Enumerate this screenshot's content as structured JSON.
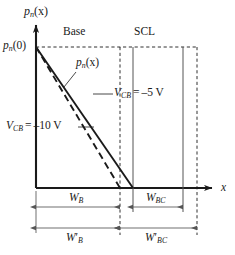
{
  "figure": {
    "axes": {
      "y_axis_label": "p_n(x)",
      "x_axis_label": "x",
      "origin_value_label": "p_n(0)"
    },
    "regions": [
      {
        "name": "base-region",
        "label": "Base"
      },
      {
        "name": "scl-region",
        "label": "SCL"
      }
    ],
    "curves": [
      {
        "name": "carrier-profile-solid",
        "label": "p_n(x)",
        "style": "solid",
        "bias_label": "V_CB = –5 V",
        "bias_value": -5,
        "bias_unit": "V"
      },
      {
        "name": "carrier-profile-dashed",
        "label": "",
        "style": "dashed",
        "bias_label": "V_CB = –10 V",
        "bias_value": -10,
        "bias_unit": "V"
      }
    ],
    "dimensions": [
      {
        "name": "base-width-reduced",
        "label": "W_B"
      },
      {
        "name": "collector-scl-width",
        "label": "W_BC"
      },
      {
        "name": "base-width-nominal",
        "label": "W'_B"
      },
      {
        "name": "collector-scl-width-nominal",
        "label": "W'_BC"
      }
    ],
    "symbols": {
      "p": "p",
      "n_sub": "n",
      "x_arg": "(x)",
      "zero_arg": "(0)",
      "V": "V",
      "CB_sub": "CB",
      "eq": "=",
      "minus5": "–5",
      "minus10": "–10",
      "volt": "V",
      "W": "W",
      "B_sub": "B",
      "BC_sub": "BC",
      "prime": "′",
      "x": "x"
    },
    "colors": {
      "line": "#1a1a1a",
      "dashed": "#1a1a1a",
      "guide": "#555555",
      "background": "#ffffff"
    }
  }
}
